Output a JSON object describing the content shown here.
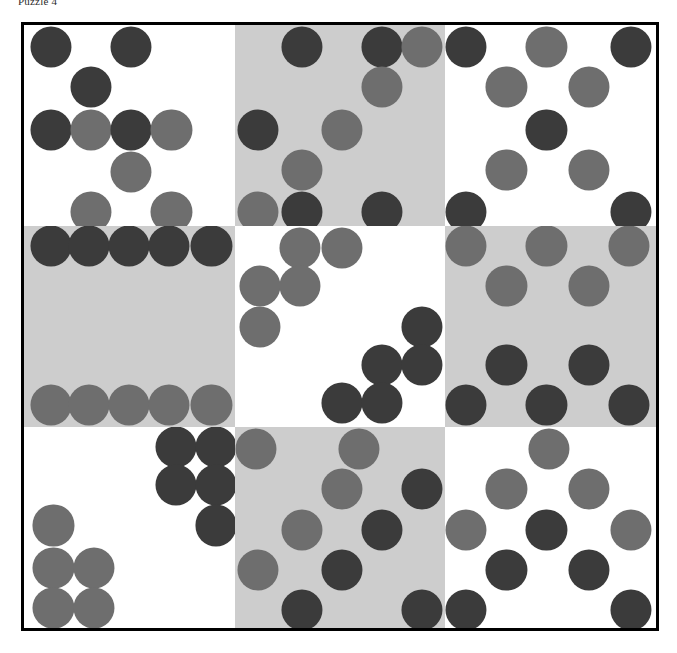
{
  "caption": {
    "text": "Puzzle 4"
  },
  "colors": {
    "dark": "#3b3b3b",
    "mid": "#6e6e6e",
    "cell_white": "#ffffff",
    "cell_gray": "#cdcdcd",
    "frame_border": "#000000",
    "page_background": "#ffffff"
  },
  "puzzle": {
    "name": "3x3-dot-grid-puzzle",
    "rows": 3,
    "cols": 3,
    "dot_diameter_pct": 19.5,
    "cells": [
      {
        "index": 0,
        "row": 0,
        "col": 0,
        "background": "white",
        "dot_count": 9,
        "dots": [
          {
            "x": 13,
            "y": 11,
            "color": "dark"
          },
          {
            "x": 51,
            "y": 11,
            "color": "dark"
          },
          {
            "x": 32,
            "y": 31,
            "color": "dark"
          },
          {
            "x": 13,
            "y": 52,
            "color": "dark"
          },
          {
            "x": 32,
            "y": 52,
            "color": "mid"
          },
          {
            "x": 51,
            "y": 52,
            "color": "dark"
          },
          {
            "x": 70,
            "y": 52,
            "color": "mid"
          },
          {
            "x": 51,
            "y": 73,
            "color": "mid"
          },
          {
            "x": 32,
            "y": 93,
            "color": "mid"
          },
          {
            "x": 70,
            "y": 93,
            "color": "mid"
          }
        ]
      },
      {
        "index": 1,
        "row": 0,
        "col": 1,
        "background": "gray",
        "dot_count": 9,
        "dots": [
          {
            "x": 32,
            "y": 11,
            "color": "dark"
          },
          {
            "x": 70,
            "y": 11,
            "color": "dark"
          },
          {
            "x": 89,
            "y": 11,
            "color": "mid"
          },
          {
            "x": 70,
            "y": 31,
            "color": "mid"
          },
          {
            "x": 11,
            "y": 52,
            "color": "dark"
          },
          {
            "x": 51,
            "y": 52,
            "color": "mid"
          },
          {
            "x": 32,
            "y": 72,
            "color": "mid"
          },
          {
            "x": 11,
            "y": 93,
            "color": "mid"
          },
          {
            "x": 32,
            "y": 93,
            "color": "dark"
          },
          {
            "x": 70,
            "y": 93,
            "color": "dark"
          }
        ]
      },
      {
        "index": 2,
        "row": 0,
        "col": 2,
        "background": "white",
        "dot_count": 9,
        "dots": [
          {
            "x": 10,
            "y": 11,
            "color": "dark"
          },
          {
            "x": 48,
            "y": 11,
            "color": "mid"
          },
          {
            "x": 88,
            "y": 11,
            "color": "dark"
          },
          {
            "x": 29,
            "y": 31,
            "color": "mid"
          },
          {
            "x": 68,
            "y": 31,
            "color": "mid"
          },
          {
            "x": 48,
            "y": 52,
            "color": "dark"
          },
          {
            "x": 29,
            "y": 72,
            "color": "mid"
          },
          {
            "x": 68,
            "y": 72,
            "color": "mid"
          },
          {
            "x": 10,
            "y": 93,
            "color": "dark"
          },
          {
            "x": 88,
            "y": 93,
            "color": "dark"
          }
        ]
      },
      {
        "index": 3,
        "row": 1,
        "col": 0,
        "background": "gray",
        "dot_count": 10,
        "dots": [
          {
            "x": 13,
            "y": 10,
            "color": "dark"
          },
          {
            "x": 31,
            "y": 10,
            "color": "dark"
          },
          {
            "x": 50,
            "y": 10,
            "color": "dark"
          },
          {
            "x": 69,
            "y": 10,
            "color": "dark"
          },
          {
            "x": 89,
            "y": 10,
            "color": "dark"
          },
          {
            "x": 13,
            "y": 89,
            "color": "mid"
          },
          {
            "x": 31,
            "y": 89,
            "color": "mid"
          },
          {
            "x": 50,
            "y": 89,
            "color": "mid"
          },
          {
            "x": 69,
            "y": 89,
            "color": "mid"
          },
          {
            "x": 89,
            "y": 89,
            "color": "mid"
          }
        ]
      },
      {
        "index": 4,
        "row": 1,
        "col": 1,
        "background": "white",
        "dot_count": 10,
        "dots": [
          {
            "x": 31,
            "y": 11,
            "color": "mid"
          },
          {
            "x": 51,
            "y": 11,
            "color": "mid"
          },
          {
            "x": 12,
            "y": 30,
            "color": "mid"
          },
          {
            "x": 31,
            "y": 30,
            "color": "mid"
          },
          {
            "x": 12,
            "y": 50,
            "color": "mid"
          },
          {
            "x": 89,
            "y": 50,
            "color": "dark"
          },
          {
            "x": 70,
            "y": 69,
            "color": "dark"
          },
          {
            "x": 89,
            "y": 69,
            "color": "dark"
          },
          {
            "x": 51,
            "y": 88,
            "color": "dark"
          },
          {
            "x": 70,
            "y": 88,
            "color": "dark"
          }
        ]
      },
      {
        "index": 5,
        "row": 1,
        "col": 2,
        "background": "gray",
        "dot_count": 10,
        "dots": [
          {
            "x": 10,
            "y": 10,
            "color": "mid"
          },
          {
            "x": 48,
            "y": 10,
            "color": "mid"
          },
          {
            "x": 87,
            "y": 10,
            "color": "mid"
          },
          {
            "x": 29,
            "y": 30,
            "color": "mid"
          },
          {
            "x": 68,
            "y": 30,
            "color": "mid"
          },
          {
            "x": 29,
            "y": 69,
            "color": "dark"
          },
          {
            "x": 68,
            "y": 69,
            "color": "dark"
          },
          {
            "x": 10,
            "y": 89,
            "color": "dark"
          },
          {
            "x": 48,
            "y": 89,
            "color": "dark"
          },
          {
            "x": 87,
            "y": 89,
            "color": "dark"
          }
        ]
      },
      {
        "index": 6,
        "row": 2,
        "col": 0,
        "background": "white",
        "dot_count": 9,
        "dots": [
          {
            "x": 72,
            "y": 10,
            "color": "dark"
          },
          {
            "x": 91,
            "y": 10,
            "color": "dark"
          },
          {
            "x": 72,
            "y": 29,
            "color": "dark"
          },
          {
            "x": 91,
            "y": 29,
            "color": "dark"
          },
          {
            "x": 91,
            "y": 49,
            "color": "dark"
          },
          {
            "x": 14,
            "y": 49,
            "color": "mid"
          },
          {
            "x": 14,
            "y": 70,
            "color": "mid"
          },
          {
            "x": 33,
            "y": 70,
            "color": "mid"
          },
          {
            "x": 14,
            "y": 90,
            "color": "mid"
          },
          {
            "x": 33,
            "y": 90,
            "color": "mid"
          }
        ]
      },
      {
        "index": 7,
        "row": 2,
        "col": 1,
        "background": "gray",
        "dot_count": 9,
        "dots": [
          {
            "x": 10,
            "y": 11,
            "color": "mid"
          },
          {
            "x": 59,
            "y": 11,
            "color": "mid"
          },
          {
            "x": 51,
            "y": 31,
            "color": "mid"
          },
          {
            "x": 89,
            "y": 31,
            "color": "dark"
          },
          {
            "x": 32,
            "y": 51,
            "color": "mid"
          },
          {
            "x": 70,
            "y": 51,
            "color": "dark"
          },
          {
            "x": 11,
            "y": 71,
            "color": "mid"
          },
          {
            "x": 51,
            "y": 71,
            "color": "dark"
          },
          {
            "x": 32,
            "y": 91,
            "color": "dark"
          },
          {
            "x": 89,
            "y": 91,
            "color": "dark"
          }
        ]
      },
      {
        "index": 8,
        "row": 2,
        "col": 2,
        "background": "white",
        "dot_count": 9,
        "dots": [
          {
            "x": 49,
            "y": 11,
            "color": "mid"
          },
          {
            "x": 29,
            "y": 31,
            "color": "mid"
          },
          {
            "x": 68,
            "y": 31,
            "color": "mid"
          },
          {
            "x": 10,
            "y": 51,
            "color": "mid"
          },
          {
            "x": 48,
            "y": 51,
            "color": "dark"
          },
          {
            "x": 88,
            "y": 51,
            "color": "mid"
          },
          {
            "x": 29,
            "y": 71,
            "color": "dark"
          },
          {
            "x": 68,
            "y": 71,
            "color": "dark"
          },
          {
            "x": 10,
            "y": 91,
            "color": "dark"
          },
          {
            "x": 88,
            "y": 91,
            "color": "dark"
          }
        ]
      }
    ]
  }
}
